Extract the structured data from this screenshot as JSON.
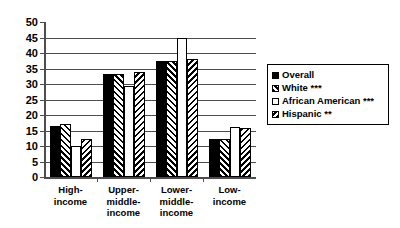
{
  "chart_data": {
    "type": "bar",
    "title": "",
    "subtitle": "",
    "xlabel": "",
    "ylabel": "",
    "ylim": [
      0,
      50
    ],
    "ytick_step": 5,
    "yticks": [
      "50",
      "45",
      "40",
      "35",
      "30",
      "25",
      "20",
      "15",
      "10",
      "5",
      "0"
    ],
    "grid": true,
    "grid_axis": "y",
    "legend_position": "right",
    "categories": [
      "High-\nincome",
      "Upper-\nmiddle-\nincome",
      "Lower-\nmiddle-\nincome",
      "Low-\nincome"
    ],
    "category_labels": [
      [
        "High-",
        "income"
      ],
      [
        "Upper-",
        "middle-",
        "income"
      ],
      [
        "Lower-",
        "middle-",
        "income"
      ],
      [
        "Low-",
        "income"
      ]
    ],
    "series": [
      {
        "name": "Overall",
        "pattern": "solid-black",
        "color": "#000000",
        "values": [
          16.3,
          33.3,
          37.5,
          12.3
        ]
      },
      {
        "name": "White ***",
        "pattern": "forward-diagonal-hatch",
        "color": "#000000",
        "values": [
          17.0,
          33.3,
          37.5,
          12.3
        ]
      },
      {
        "name": "African American ***",
        "pattern": "empty-white",
        "color": "#ffffff",
        "values": [
          10.0,
          29.5,
          45.0,
          16.0
        ]
      },
      {
        "name": "Hispanic **",
        "pattern": "backward-diagonal-hatch",
        "color": "#000000",
        "values": [
          12.3,
          34.0,
          38.0,
          15.8
        ]
      }
    ]
  },
  "legend": {
    "items": [
      {
        "label": "Overall"
      },
      {
        "label": "White ***"
      },
      {
        "label": "African American ***"
      },
      {
        "label": "Hispanic **"
      }
    ]
  }
}
